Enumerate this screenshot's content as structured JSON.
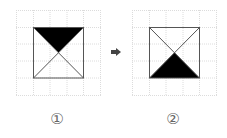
{
  "figures": [
    {
      "id": "figure-1",
      "label": "①",
      "shaded": "top-triangle"
    },
    {
      "id": "figure-2",
      "label": "②",
      "shaded": "bottom-triangle"
    }
  ],
  "arrow": {
    "icon": "right-arrow-icon"
  },
  "grid": {
    "cells": 5,
    "line_color": "#dcdcdc",
    "shape_color": "#555555",
    "fill_color": "#000000"
  }
}
